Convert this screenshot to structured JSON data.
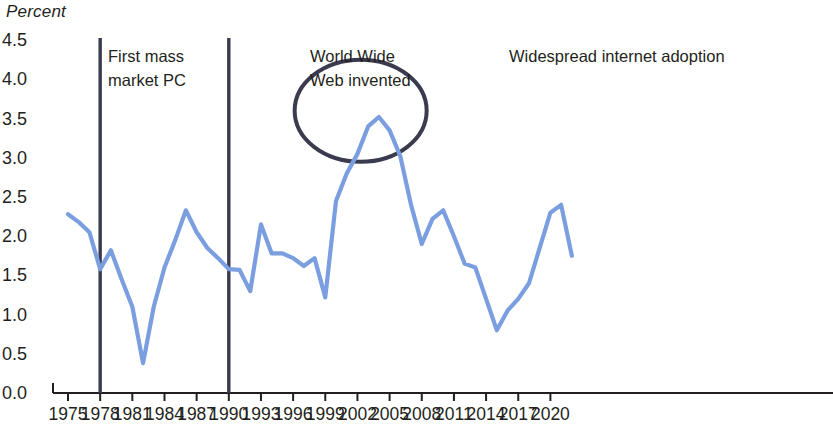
{
  "title_axis": "Percent",
  "chart_data": {
    "type": "line",
    "title": "",
    "subtitle": "",
    "xlabel": "",
    "ylabel": "Percent",
    "ylim": [
      0.0,
      4.5
    ],
    "xlim": [
      1975,
      2022
    ],
    "grid": false,
    "legend": "none",
    "y_ticks": [
      "0.0",
      "0.5",
      "1.0",
      "1.5",
      "2.0",
      "2.5",
      "3.0",
      "3.5",
      "4.0",
      "4.5"
    ],
    "y_tick_values": [
      0.0,
      0.5,
      1.0,
      1.5,
      2.0,
      2.5,
      3.0,
      3.5,
      4.0,
      4.5
    ],
    "x_ticks": [
      "1975",
      "1978",
      "1981",
      "1984",
      "1987",
      "1990",
      "1993",
      "1996",
      "1999",
      "2002",
      "2005",
      "2008",
      "2011",
      "2014",
      "2017",
      "2020"
    ],
    "x_tick_values": [
      1975,
      1978,
      1981,
      1984,
      1987,
      1990,
      1993,
      1996,
      1999,
      2002,
      2005,
      2008,
      2011,
      2014,
      2017,
      2020
    ],
    "series": [
      {
        "name": "Productivity growth",
        "color": "#7b9ee0",
        "x": [
          1975,
          1976,
          1977,
          1978,
          1979,
          1980,
          1981,
          1982,
          1983,
          1984,
          1985,
          1986,
          1987,
          1988,
          1989,
          1990,
          1991,
          1992,
          1993,
          1994,
          1995,
          1996,
          1997,
          1998,
          1999,
          2000,
          2001,
          2002,
          2003,
          2004,
          2005,
          2006,
          2007,
          2008,
          2009,
          2010,
          2011,
          2012,
          2013,
          2014,
          2015,
          2016,
          2017,
          2018,
          2019,
          2020,
          2021,
          2022
        ],
        "y": [
          2.28,
          2.18,
          2.05,
          1.58,
          1.82,
          1.45,
          1.1,
          0.38,
          1.1,
          1.6,
          1.95,
          2.33,
          2.05,
          1.85,
          1.72,
          1.58,
          1.57,
          1.3,
          2.15,
          1.78,
          1.78,
          1.72,
          1.62,
          1.72,
          1.22,
          2.45,
          2.8,
          3.05,
          3.4,
          3.52,
          3.35,
          3.02,
          2.4,
          1.9,
          2.22,
          2.33,
          2.0,
          1.65,
          1.6,
          1.2,
          0.8,
          1.05,
          1.2,
          1.4,
          1.85,
          2.3,
          2.4,
          1.75
        ]
      }
    ],
    "annotations": [
      {
        "id": "first-mass-market-pc",
        "kind": "vline-with-label",
        "x": 1978,
        "label": "First mass\nmarket PC",
        "line_color": "#3b3b50"
      },
      {
        "id": "world-wide-web-invented",
        "kind": "vline-with-label",
        "x": 1990,
        "label": "World Wide\nWeb invented",
        "line_color": "#3b3b50"
      },
      {
        "id": "widespread-internet-adoption",
        "kind": "ellipse-with-label",
        "label": "Widespread internet adoption",
        "ellipse_center_x": 2002.3,
        "ellipse_center_y": 3.6,
        "line_color": "#3b3b50"
      }
    ]
  },
  "colors": {
    "line": "#7b9ee0",
    "annotation": "#3b3b50",
    "axis": "#231f20",
    "text": "#231f20",
    "background": "#ffffff"
  }
}
